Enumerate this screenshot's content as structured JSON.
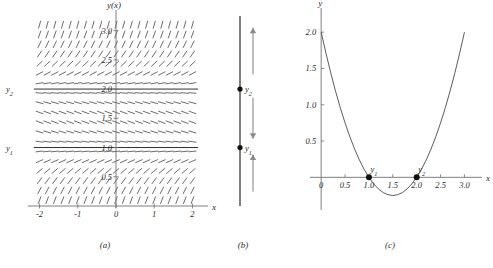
{
  "figure": {
    "panels": [
      {
        "id": "a",
        "caption": "(a)"
      },
      {
        "id": "b",
        "caption": "(b)"
      },
      {
        "id": "c",
        "caption": "(c)"
      }
    ]
  },
  "panel_a": {
    "type": "slope-field",
    "y_axis_label": "y(x)",
    "x_axis_label": "x",
    "x_ticks": [
      "-2",
      "-1",
      "0",
      "1",
      "2"
    ],
    "x_tick_values": [
      -2,
      -1,
      0,
      1,
      2
    ],
    "y_ticks": [
      "0.5",
      "1.0",
      "1.5",
      "2.0",
      "2.5",
      "3.0"
    ],
    "y_tick_values": [
      0.5,
      1.0,
      1.5,
      2.0,
      2.5,
      3.0
    ],
    "xlim": [
      -2.25,
      2.25
    ],
    "ylim": [
      0.0,
      3.25
    ],
    "equilibrium_labels": [
      "y_1",
      "y_2"
    ],
    "equilibrium_label_1": "y",
    "equilibrium_sub_1": "1",
    "equilibrium_label_2": "y",
    "equilibrium_sub_2": "2",
    "equilibrium_values": [
      1.0,
      2.0
    ],
    "slope_function": "(y-1)(y-2)",
    "description": "Direction field of dy/dx = (y-1)(y-2) with horizontal equilibrium solutions at y=1 and y=2"
  },
  "panel_b": {
    "type": "phase-line",
    "equilibrium_points": [
      {
        "label": "y",
        "sub": "1",
        "value": 1.0
      },
      {
        "label": "y",
        "sub": "2",
        "value": 2.0
      }
    ],
    "arrows": [
      {
        "region": "above-y2",
        "direction": "up"
      },
      {
        "region": "between",
        "direction": "down"
      },
      {
        "region": "below-y1",
        "direction": "up"
      }
    ],
    "line_min": 0.0,
    "line_max": 3.25
  },
  "chart_data": {
    "type": "line",
    "title": "",
    "xlabel": "x",
    "ylabel": "y",
    "xlim": [
      -0.15,
      3.2
    ],
    "ylim": [
      -0.45,
      2.25
    ],
    "x_ticks": [
      "0",
      "0.5",
      "1.0",
      "1.5",
      "2.0",
      "2.5",
      "3.0"
    ],
    "x_tick_values": [
      0,
      0.5,
      1.0,
      1.5,
      2.0,
      2.5,
      3.0
    ],
    "y_ticks": [
      "0.5",
      "1.0",
      "1.5",
      "2.0"
    ],
    "y_tick_values": [
      0.5,
      1.0,
      1.5,
      2.0
    ],
    "grid": false,
    "legend": "none",
    "series": [
      {
        "name": "f(y) = (y-1)(y-2)",
        "x": [
          0.0,
          0.1,
          0.2,
          0.3,
          0.4,
          0.5,
          0.6,
          0.7,
          0.8,
          0.9,
          1.0,
          1.1,
          1.2,
          1.3,
          1.4,
          1.5,
          1.6,
          1.7,
          1.8,
          1.9,
          2.0,
          2.1,
          2.2,
          2.3,
          2.4,
          2.5,
          2.6,
          2.7,
          2.8,
          2.9,
          3.0
        ],
        "values": [
          2.0,
          1.71,
          1.44,
          1.19,
          0.96,
          0.75,
          0.56,
          0.39,
          0.24,
          0.11,
          0.0,
          -0.09,
          -0.16,
          -0.21,
          -0.24,
          -0.25,
          -0.24,
          -0.21,
          -0.16,
          -0.09,
          0.0,
          0.11,
          0.24,
          0.39,
          0.56,
          0.75,
          0.96,
          1.19,
          1.44,
          1.71,
          2.0
        ]
      }
    ],
    "annotations": [
      {
        "label": "y",
        "sub": "1",
        "x": 1.0,
        "y": 0.0
      },
      {
        "label": "y",
        "sub": "2",
        "x": 2.0,
        "y": 0.0
      }
    ],
    "vertex": {
      "x": 1.5,
      "y": -0.25
    }
  }
}
